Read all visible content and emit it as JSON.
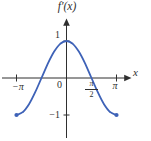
{
  "figure": {
    "title": "f′(x)",
    "x_axis_label": "x",
    "origin_label": "0",
    "y_tick_labels": {
      "one": "1",
      "neg_one": "−1"
    },
    "x_tick_labels": {
      "neg_pi": "−π",
      "pi": "π"
    },
    "half_pi_fraction": {
      "numerator": "π",
      "denominator": "2"
    },
    "colors": {
      "curve": "#3e62b7",
      "axis": "#2f2f2f",
      "text": "#2f2f2f",
      "background": "#ffffff"
    }
  },
  "chart_data": {
    "type": "line",
    "title": "f′(x)",
    "xlabel": "x",
    "ylabel": "",
    "function": "f′(x) = cos x",
    "x_range": [
      -3.1416,
      3.1416
    ],
    "y_range": [
      -1,
      1
    ],
    "x_tick_values": [
      -3.1416,
      1.5708,
      3.1416
    ],
    "x_tick_labels": [
      "−π",
      "π/2",
      "π"
    ],
    "y_tick_values": [
      1,
      -1
    ],
    "y_tick_labels": [
      "1",
      "−1"
    ],
    "grid": false,
    "legend": false,
    "series": [
      {
        "name": "f′(x) = cos x",
        "color": "#3e62b7",
        "x": [
          -3.1416,
          -2.7489,
          -2.3562,
          -1.9635,
          -1.5708,
          -1.1781,
          -0.7854,
          -0.3927,
          0,
          0.3927,
          0.7854,
          1.1781,
          1.5708,
          1.9635,
          2.3562,
          2.7489,
          3.1416
        ],
        "y": [
          -1,
          -0.9239,
          -0.7071,
          -0.3827,
          0,
          0.3827,
          0.7071,
          0.9239,
          1,
          0.9239,
          0.7071,
          0.3827,
          0,
          -0.3827,
          -0.7071,
          -0.9239,
          -1
        ]
      }
    ],
    "endpoints": [
      {
        "x": -3.1416,
        "y": -1,
        "style": "filled-dot"
      },
      {
        "x": 3.1416,
        "y": -1,
        "style": "filled-dot"
      }
    ]
  }
}
